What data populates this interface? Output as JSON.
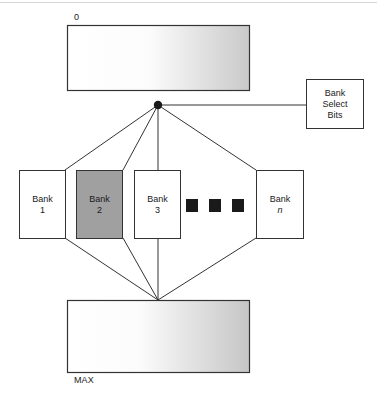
{
  "figure": {
    "type": "block-diagram",
    "title_caption": "",
    "address_space": {
      "top_label": "0",
      "bottom_label": "MAX"
    },
    "memory_top": {
      "name": "address-space-top-block",
      "fill": "gradient-white-to-gray"
    },
    "memory_bottom": {
      "name": "address-space-bottom-block",
      "fill": "gradient-white-to-gray"
    },
    "bank_select": {
      "line1": "Bank",
      "line2": "Select",
      "line3": "Bits"
    },
    "banks": [
      {
        "line1": "Bank",
        "line2": "1",
        "italic_index": false,
        "highlighted": false
      },
      {
        "line1": "Bank",
        "line2": "2",
        "italic_index": false,
        "highlighted": true
      },
      {
        "line1": "Bank",
        "line2": "3",
        "italic_index": false,
        "highlighted": false
      },
      {
        "line1": "Bank",
        "line2": "n",
        "italic_index": true,
        "highlighted": false
      }
    ],
    "ellipsis_squares": 3,
    "colors": {
      "stroke": "#333333",
      "highlight_fill": "#a0a0a0",
      "ellipsis_fill": "#1a1a1a",
      "gradient_start": "#ffffff",
      "gradient_end": "#c8c8c8",
      "text": "#1a1a1a"
    }
  }
}
